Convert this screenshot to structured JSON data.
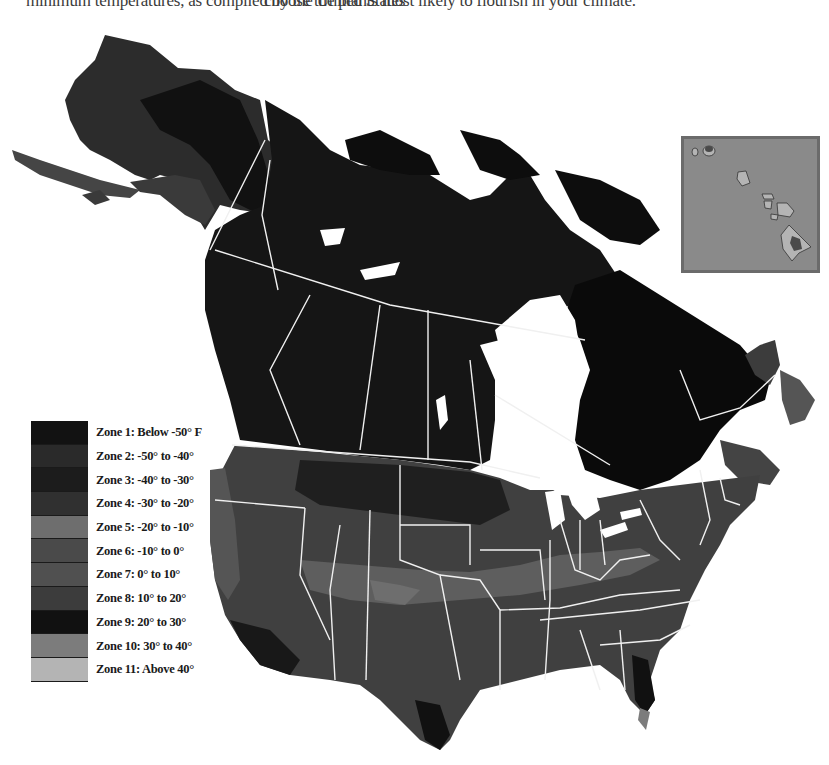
{
  "caption": {
    "left": "minimum temperatures, as compiled by the United States",
    "right": "choose the plants most likely to flourish in your climate."
  },
  "map": {
    "title": "Plant Hardiness Zones of North America",
    "regions": [
      "Alaska",
      "Canada",
      "Contiguous United States",
      "Hawaii (inset)"
    ],
    "border_color": "#f0f0f0",
    "water_color": "#ffffff"
  },
  "legend": {
    "items": [
      {
        "zone": "Zone 1",
        "label": "Zone 1: Below -50° F",
        "color": "#121212"
      },
      {
        "zone": "Zone 2",
        "label": "Zone 2: -50° to -40°",
        "color": "#2a2a2a"
      },
      {
        "zone": "Zone 3",
        "label": "Zone 3: -40° to -30°",
        "color": "#1c1c1c"
      },
      {
        "zone": "Zone 4",
        "label": "Zone 4: -30° to -20°",
        "color": "#303030"
      },
      {
        "zone": "Zone 5",
        "label": "Zone 5: -20° to -10°",
        "color": "#6e6e6e"
      },
      {
        "zone": "Zone 6",
        "label": "Zone 6: -10° to 0°",
        "color": "#4a4a4a"
      },
      {
        "zone": "Zone 7",
        "label": "Zone 7: 0° to 10°",
        "color": "#505050"
      },
      {
        "zone": "Zone 8",
        "label": "Zone 8: 10° to 20°",
        "color": "#3c3c3c"
      },
      {
        "zone": "Zone 9",
        "label": "Zone 9: 20° to 30°",
        "color": "#111111"
      },
      {
        "zone": "Zone 10",
        "label": "Zone 10: 30° to 40°",
        "color": "#7c7c7c"
      },
      {
        "zone": "Zone 11",
        "label": "Zone 11: Above 40°",
        "color": "#b4b4b4"
      }
    ]
  },
  "hawaii_inset": {
    "label": "Hawaii",
    "background": "#8a8a8a",
    "island_color": "#b4b4b4",
    "peak_color": "#4a4a4a"
  }
}
